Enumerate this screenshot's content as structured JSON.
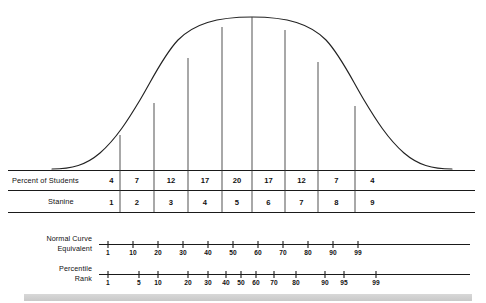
{
  "figure": {
    "ink_color": "#1a1a1a",
    "background": "#ffffff",
    "footer_band_color": "#d0d0d0"
  },
  "chart_data": {
    "type": "bar",
    "xlabel": "",
    "ylabel": "",
    "grid": false,
    "legend": "none",
    "categories": [
      "1",
      "2",
      "3",
      "4",
      "5",
      "6",
      "7",
      "8",
      "9"
    ],
    "values": [
      4,
      7,
      12,
      17,
      20,
      17,
      12,
      7,
      4
    ],
    "series": [
      {
        "name": "Percent of Students",
        "values": [
          4,
          7,
          12,
          17,
          20,
          17,
          12,
          7,
          4
        ]
      },
      {
        "name": "Stanine",
        "values": [
          1,
          2,
          3,
          4,
          5,
          6,
          7,
          8,
          9
        ]
      }
    ],
    "curve": {
      "shape": "normal",
      "mean_stanine": 5,
      "annotation": "bell curve divided into 9 stanine bands"
    },
    "scales": [
      {
        "name": "Normal Curve Equivalent",
        "ticks": [
          "1",
          "10",
          "20",
          "30",
          "40",
          "50",
          "60",
          "70",
          "80",
          "90",
          "99"
        ],
        "spacing": "linear"
      },
      {
        "name": "Percentile Rank",
        "ticks": [
          "1",
          "5",
          "10",
          "20",
          "30",
          "40",
          "50",
          "60",
          "70",
          "80",
          "90",
          "95",
          "99"
        ],
        "spacing": "normal-probability"
      }
    ]
  },
  "table": {
    "rows": [
      {
        "label": "Percent of Students",
        "cells": [
          "4",
          "7",
          "12",
          "17",
          "20",
          "17",
          "12",
          "7",
          "4"
        ]
      },
      {
        "label": "Stanine",
        "cells": [
          "1",
          "2",
          "3",
          "4",
          "5",
          "6",
          "7",
          "8",
          "9"
        ]
      }
    ]
  },
  "nce_scale": {
    "label_line1": "Normal Curve",
    "label_line2": "Equivalent",
    "ticks": [
      {
        "value": "1",
        "x": 108
      },
      {
        "value": "10",
        "x": 133
      },
      {
        "value": "20",
        "x": 158
      },
      {
        "value": "30",
        "x": 183
      },
      {
        "value": "40",
        "x": 208
      },
      {
        "value": "50",
        "x": 233
      },
      {
        "value": "60",
        "x": 258
      },
      {
        "value": "70",
        "x": 283
      },
      {
        "value": "80",
        "x": 308
      },
      {
        "value": "90",
        "x": 333
      },
      {
        "value": "99",
        "x": 358
      }
    ]
  },
  "percentile_scale": {
    "label_line1": "Percentile",
    "label_line2": "Rank",
    "ticks": [
      {
        "value": "1",
        "x": 108
      },
      {
        "value": "5",
        "x": 139
      },
      {
        "value": "10",
        "x": 158
      },
      {
        "value": "20",
        "x": 188
      },
      {
        "value": "30",
        "x": 208
      },
      {
        "value": "40",
        "x": 226
      },
      {
        "value": "50",
        "x": 241
      },
      {
        "value": "60",
        "x": 256
      },
      {
        "value": "70",
        "x": 274
      },
      {
        "value": "80",
        "x": 296
      },
      {
        "value": "90",
        "x": 325
      },
      {
        "value": "95",
        "x": 344
      },
      {
        "value": "99",
        "x": 376
      }
    ]
  },
  "geometry": {
    "rules": [
      {
        "name": "top-rule",
        "y": 170,
        "x1": 8,
        "x2": 475
      },
      {
        "name": "mid-rule",
        "y": 190,
        "x1": 8,
        "x2": 475
      },
      {
        "name": "bottom-rule",
        "y": 212,
        "x1": 8,
        "x2": 475
      },
      {
        "name": "nce-axis",
        "y": 244,
        "x1": 99,
        "x2": 470
      },
      {
        "name": "pct-axis",
        "y": 274,
        "x1": 99,
        "x2": 470
      }
    ],
    "band_dividers_x": [
      120,
      154,
      188,
      222,
      252,
      285,
      318,
      355
    ],
    "band_edges_x": [
      103,
      120,
      154,
      188,
      222,
      252,
      285,
      318,
      355,
      390
    ]
  }
}
